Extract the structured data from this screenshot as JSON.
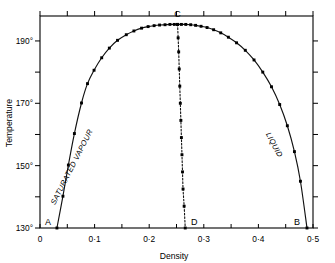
{
  "chart_data": {
    "type": "line",
    "title": "",
    "xlabel": "Density",
    "ylabel": "Temperature",
    "xlim": [
      0,
      0.5
    ],
    "ylim": [
      130,
      198
    ],
    "grid": false,
    "legend": false,
    "x_ticks": [
      {
        "value": 0,
        "label": "0"
      },
      {
        "value": 0.1,
        "label": "0·1"
      },
      {
        "value": 0.2,
        "label": "0·2"
      },
      {
        "value": 0.3,
        "label": "0·3"
      },
      {
        "value": 0.4,
        "label": "0·4"
      },
      {
        "value": 0.5,
        "label": "0·5"
      }
    ],
    "x_minor_ticks": [
      0.05,
      0.15,
      0.25,
      0.35,
      0.45
    ],
    "y_ticks": [
      {
        "value": 130,
        "label": "130°"
      },
      {
        "value": 150,
        "label": "150°"
      },
      {
        "value": 170,
        "label": "170°"
      },
      {
        "value": 190,
        "label": "190°"
      }
    ],
    "y_minor_ticks": [
      140,
      160,
      180
    ],
    "annotations": [
      {
        "name": "A",
        "text": "A",
        "x": 0.031,
        "y": 130.0
      },
      {
        "name": "B",
        "text": "B",
        "x": 0.489,
        "y": 130.0
      },
      {
        "name": "C",
        "text": "C",
        "x": 0.252,
        "y": 195.3
      },
      {
        "name": "D",
        "text": "D",
        "x": 0.266,
        "y": 130.0
      }
    ],
    "region_labels": [
      {
        "name": "saturated-vapour",
        "text": "SATURATED VAPOUR"
      },
      {
        "name": "liquid",
        "text": "LIQUID"
      }
    ],
    "series": [
      {
        "name": "saturated-vapour-branch",
        "style": "solid-with-markers",
        "points": [
          [
            0.031,
            130.0
          ],
          [
            0.042,
            140.2
          ],
          [
            0.052,
            150.2
          ],
          [
            0.063,
            160.3
          ],
          [
            0.076,
            170.1
          ],
          [
            0.087,
            176.3
          ],
          [
            0.099,
            180.6
          ],
          [
            0.113,
            184.6
          ],
          [
            0.127,
            187.7
          ],
          [
            0.142,
            190.2
          ],
          [
            0.158,
            192.0
          ],
          [
            0.172,
            193.2
          ],
          [
            0.186,
            194.1
          ],
          [
            0.198,
            194.6
          ],
          [
            0.209,
            194.9
          ],
          [
            0.219,
            195.1
          ],
          [
            0.229,
            195.2
          ],
          [
            0.238,
            195.3
          ],
          [
            0.246,
            195.3
          ],
          [
            0.252,
            195.3
          ]
        ]
      },
      {
        "name": "liquid-branch",
        "style": "solid-with-markers",
        "points": [
          [
            0.252,
            195.3
          ],
          [
            0.259,
            195.3
          ],
          [
            0.267,
            195.3
          ],
          [
            0.276,
            195.2
          ],
          [
            0.285,
            195.0
          ],
          [
            0.295,
            194.7
          ],
          [
            0.306,
            194.3
          ],
          [
            0.318,
            193.6
          ],
          [
            0.331,
            192.6
          ],
          [
            0.345,
            191.2
          ],
          [
            0.36,
            189.4
          ],
          [
            0.376,
            187.0
          ],
          [
            0.392,
            183.9
          ],
          [
            0.408,
            180.0
          ],
          [
            0.424,
            175.3
          ],
          [
            0.439,
            169.6
          ],
          [
            0.453,
            162.8
          ],
          [
            0.466,
            154.5
          ],
          [
            0.477,
            145.0
          ],
          [
            0.489,
            130.0
          ]
        ]
      },
      {
        "name": "rectilinear-diameter",
        "style": "dotted-with-markers",
        "points": [
          [
            0.252,
            195.3
          ],
          [
            0.253,
            191.0
          ],
          [
            0.254,
            186.5
          ],
          [
            0.255,
            181.0
          ],
          [
            0.256,
            175.5
          ],
          [
            0.257,
            170.0
          ],
          [
            0.258,
            164.5
          ],
          [
            0.259,
            159.0
          ],
          [
            0.26,
            153.5
          ],
          [
            0.261,
            148.0
          ],
          [
            0.262,
            142.5
          ],
          [
            0.264,
            137.0
          ],
          [
            0.266,
            130.0
          ]
        ]
      }
    ]
  }
}
